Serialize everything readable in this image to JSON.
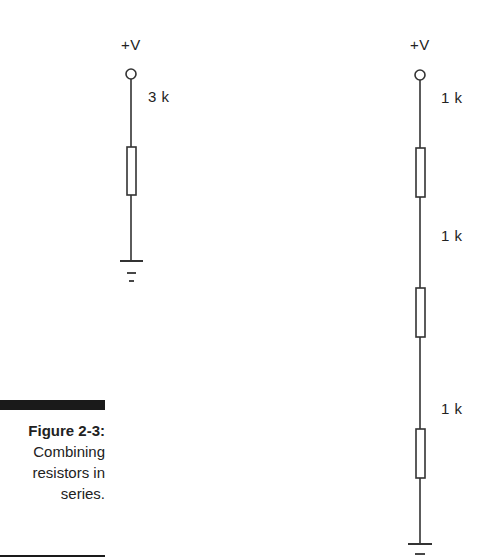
{
  "figure": {
    "number": "Figure 2-3:",
    "caption_lines": [
      "Combining",
      "resistors in",
      "series."
    ]
  },
  "left_circuit": {
    "supply_label": "+V",
    "resistors": [
      {
        "label": "3 k"
      }
    ]
  },
  "right_circuit": {
    "supply_label": "+V",
    "resistors": [
      {
        "label": "1 k"
      },
      {
        "label": "1 k"
      },
      {
        "label": "1 k"
      }
    ]
  },
  "colors": {
    "line": "#333333",
    "text": "#222222",
    "background": "#ffffff"
  }
}
